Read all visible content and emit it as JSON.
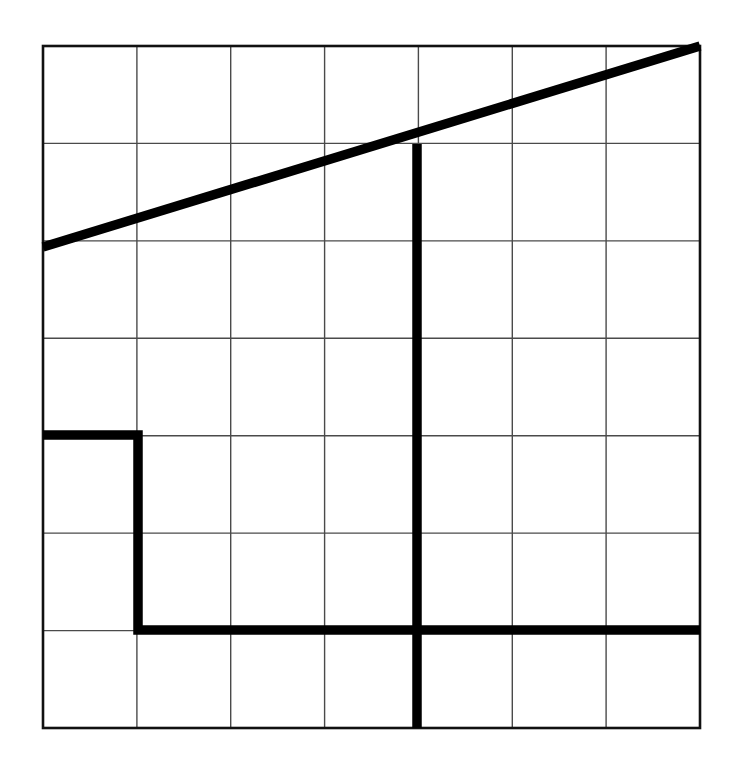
{
  "figure": {
    "canvas_width": 736,
    "canvas_height": 770,
    "background_color": "#ffffff"
  },
  "grid": {
    "x0": 43,
    "y0": 46,
    "x1": 700,
    "y1": 728,
    "columns": 7,
    "rows": 7,
    "cell_width": 93.857,
    "cell_height": 97.429,
    "thin_line_color": "#4a4a4a",
    "thin_line_width": 1.4,
    "border_color": "#111111",
    "border_width": 2.6,
    "x_ticks": [
      43,
      136.9,
      230.7,
      324.6,
      418.4,
      512.3,
      606.1,
      700
    ],
    "y_ticks": [
      46,
      143.4,
      240.9,
      338.3,
      435.7,
      533.1,
      630.6,
      728
    ]
  },
  "thick_strokes": {
    "color": "#000000",
    "width": 9.5,
    "paths": [
      {
        "name": "diagonal-ramp",
        "description": "Diagonal line from left border up to top-right corner",
        "points": [
          [
            43,
            247
          ],
          [
            700,
            46
          ]
        ]
      },
      {
        "name": "vertical-divider",
        "description": "Vertical line from diagonal down to bottom border",
        "points": [
          [
            417,
            144
          ],
          [
            417,
            728
          ]
        ]
      },
      {
        "name": "step-polyline",
        "description": "Step shape: left border right, down, then right to right border",
        "points": [
          [
            43,
            435
          ],
          [
            138,
            435
          ],
          [
            138,
            630
          ],
          [
            700,
            630
          ]
        ]
      }
    ]
  }
}
